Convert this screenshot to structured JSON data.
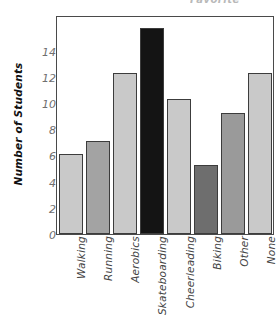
{
  "top_partial_text": "Favorite",
  "chart_data": {
    "type": "bar",
    "title": "",
    "xlabel": "",
    "ylabel": "Number of Students",
    "ylim": [
      0,
      15.8
    ],
    "yticks": [
      0,
      2,
      4,
      6,
      8,
      10,
      12,
      14
    ],
    "grid": false,
    "legend": null,
    "categories": [
      "Walking",
      "Running",
      "Aerobics",
      "Skateboarding",
      "Cheerleading",
      "Biking",
      "Other",
      "None"
    ],
    "values": [
      5.8,
      6.8,
      11.7,
      15.0,
      9.8,
      5.0,
      8.8,
      11.7
    ],
    "bar_colors": [
      "#c9c9c9",
      "#a3a3a3",
      "#c9c9c9",
      "#141414",
      "#c9c9c9",
      "#6e6e6e",
      "#9a9a9a",
      "#c9c9c9"
    ],
    "bar_edge_color": "#3c3c3c",
    "axis_color": "#4a4a4a",
    "tick_label_color": "#6f6f6f"
  }
}
